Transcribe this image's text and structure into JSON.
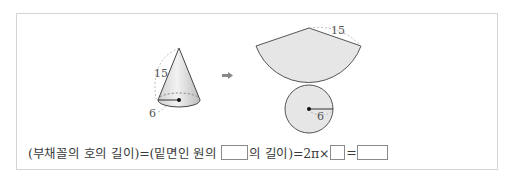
{
  "figure": {
    "cone": {
      "slant_label": "15",
      "radius_label": "6"
    },
    "arrow_icon": "right-arrow",
    "net": {
      "sector_radius_label": "15",
      "circle_radius_label": "6"
    }
  },
  "formula": {
    "part1": "(부채꼴의 호의 길이)=(밑면인 원의",
    "part2": "의 길이)=2π×",
    "part3": "=",
    "blanks": [
      "",
      "",
      ""
    ]
  },
  "colors": {
    "shape_fill": "#e6e6e6",
    "outline": "#555555",
    "dashed": "#aaaaaa"
  }
}
